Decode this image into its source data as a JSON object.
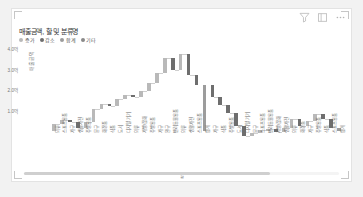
{
  "visual": {
    "title": "매출금액, 할 및 분류명",
    "x_axis_title": "할",
    "y_axis_title": "매출금액"
  },
  "toolbar": {
    "filter_label": "필터",
    "focus_label": "포커스 모드",
    "more_label": "추가 옵션"
  },
  "legend": [
    {
      "label": "증가",
      "color": "#b9b9b9"
    },
    {
      "label": "감소",
      "color": "#6e6e6e"
    },
    {
      "label": "합계",
      "color": "#9c9c9c"
    },
    {
      "label": "기타",
      "color": "#8a8a8a"
    }
  ],
  "colors": {
    "increase": "#b9b9b9",
    "decrease": "#6e6e6e",
    "total": "#9c9c9c",
    "connector": "#cfcfcf",
    "axis_text": "#777777"
  },
  "chart_data": {
    "type": "bar",
    "subtype": "waterfall",
    "title": "매출금액, 할 및 분류명",
    "xlabel": "할",
    "ylabel": "매출금액",
    "grid": false,
    "legend_position": "top-left",
    "ylim": [
      0,
      4.0
    ],
    "yticks": [
      1.0,
      2.0,
      3.0,
      4.0
    ],
    "ytick_labels": [
      "1.0억",
      "2.0억",
      "3.0억",
      "4.0억"
    ],
    "categories": [
      "의류",
      "스포츠용품",
      "가구",
      "생활가전",
      "주방용품",
      "문구",
      "화장품",
      "식품",
      "도서",
      "디지털 기기",
      "의류",
      "가방/잡화",
      "주방용품",
      "가구",
      "완구",
      "반려동물용품",
      "의류",
      "생활가전",
      "스포츠용품",
      "합계",
      "가구",
      "식품",
      "주방용품",
      "도서",
      "디지털 기기",
      "문구",
      "스포츠용품",
      "반려동물용품",
      "가방/잡화",
      "생활가전",
      "의류",
      "화장품",
      "가구",
      "주방용품",
      "식품",
      "스포츠용품",
      "합계"
    ],
    "series": [
      {
        "name": "매출금액",
        "values": [
          0.34,
          0.22,
          0.14,
          0.27,
          0.31,
          0.62,
          0.23,
          0.09,
          0.35,
          0.21,
          0.12,
          0.28,
          0.41,
          0.46,
          0.73,
          0.58,
          0.79,
          1.02,
          0.49,
          3.42,
          0.56,
          0.43,
          0.37,
          0.62,
          0.51,
          0.17,
          0.11,
          0.08,
          0.14,
          0.19,
          0.44,
          0.38,
          0.26,
          0.33,
          0.21,
          0.47,
          2.86
        ],
        "types": [
          "increase",
          "increase",
          "decrease",
          "decrease",
          "increase",
          "increase",
          "increase",
          "decrease",
          "increase",
          "increase",
          "decrease",
          "increase",
          "increase",
          "increase",
          "increase",
          "decrease",
          "increase",
          "decrease",
          "decrease",
          "total",
          "decrease",
          "decrease",
          "decrease",
          "decrease",
          "decrease",
          "increase",
          "increase",
          "increase",
          "decrease",
          "increase",
          "increase",
          "decrease",
          "increase",
          "increase",
          "decrease",
          "decrease",
          "total"
        ]
      }
    ]
  }
}
